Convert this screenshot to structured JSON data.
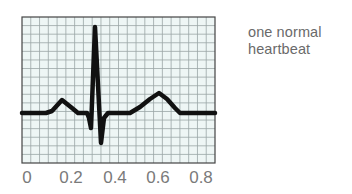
{
  "caption": {
    "line1": "one normal",
    "line2": "heartbeat"
  },
  "chart_data": {
    "type": "line",
    "title": "one normal heartbeat",
    "xlabel": "",
    "ylabel": "",
    "x_ticks": [
      "0",
      "0.2",
      "0.4",
      "0.6",
      "0.8"
    ],
    "xlim": [
      0,
      0.85
    ],
    "grid": true,
    "grid_columns": 22,
    "grid_rows": 17,
    "waveform_description": "ECG trace: flat baseline, P wave bump (~0.15), QRS complex with Q dip, tall R spike (~0.3) and S dip, flat ST segment, broad T wave (~0.6), return to baseline",
    "series": [
      {
        "name": "ECG",
        "points_px": [
          [
            22,
            113
          ],
          [
            46,
            113
          ],
          [
            52,
            111
          ],
          [
            62,
            100
          ],
          [
            72,
            108
          ],
          [
            78,
            113
          ],
          [
            87,
            113
          ],
          [
            89,
            118
          ],
          [
            91,
            128
          ],
          [
            95,
            27
          ],
          [
            101,
            143
          ],
          [
            104,
            118
          ],
          [
            108,
            113
          ],
          [
            130,
            113
          ],
          [
            140,
            107
          ],
          [
            150,
            99
          ],
          [
            159,
            93
          ],
          [
            167,
            99
          ],
          [
            175,
            108
          ],
          [
            180,
            113
          ],
          [
            215,
            113
          ]
        ]
      }
    ]
  },
  "colors": {
    "grid_background": "#eef6f5",
    "grid_line": "#9aa6a6",
    "grid_border": "#444444",
    "trace": "#111111",
    "text": "#6a6a6a"
  },
  "axis": {
    "ticks": [
      {
        "label": "0",
        "x": 27
      },
      {
        "label": "0.2",
        "x": 71
      },
      {
        "label": "0.4",
        "x": 115
      },
      {
        "label": "0.6",
        "x": 158
      },
      {
        "label": "0.8",
        "x": 201
      }
    ]
  }
}
